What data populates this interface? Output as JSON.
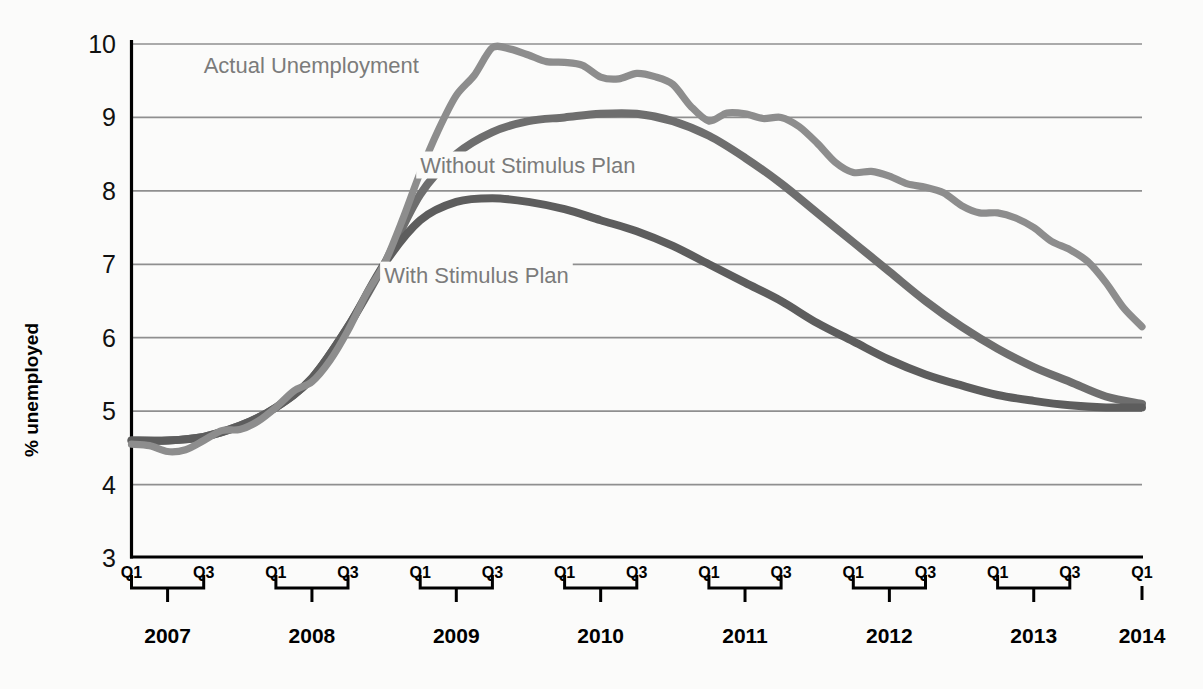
{
  "chart_data": {
    "type": "line",
    "title": "",
    "xlabel": "",
    "ylabel": "% unemployed",
    "ylim": [
      3,
      10
    ],
    "yticks": [
      3,
      4,
      5,
      6,
      7,
      8,
      9,
      10
    ],
    "ytick_labels": [
      "3",
      "4",
      "5",
      "6",
      "7",
      "8",
      "9",
      "10"
    ],
    "grid": true,
    "grid_axis": "y",
    "legend_position": "inline-annotations",
    "x_start": "2007 Q1",
    "x_end": "2014 Q1",
    "x_unit": "quarter",
    "years": [
      "2007",
      "2008",
      "2009",
      "2010",
      "2011",
      "2012",
      "2013",
      "2014"
    ],
    "quarter_tick_labels": [
      "Q1",
      "Q3"
    ],
    "final_year_quarter_labels": [
      "Q1"
    ],
    "colors": {
      "actual": "#8d8d8d",
      "without_stimulus": "#6e6e6e",
      "with_stimulus": "#5d5d5d",
      "gridline": "#8f8f8f",
      "axis": "#000000",
      "background": "#fbfbfa",
      "label_text": "#7b7b7b"
    },
    "series": [
      {
        "name": "Actual Unemployment",
        "label": "Actual Unemployment",
        "color": "#8d8d8d",
        "x": [
          "2007Q1",
          "2007Q2",
          "2007Q3",
          "2007Q4",
          "2008Q1",
          "2008Q2",
          "2008Q3",
          "2008Q4",
          "2009Q1",
          "2009Q2",
          "2009Q3",
          "2009Q4",
          "2010Q1",
          "2010Q2",
          "2010Q3",
          "2010Q4",
          "2011Q1",
          "2011Q2",
          "2011Q3",
          "2011Q4",
          "2012Q1",
          "2012Q2",
          "2012Q3",
          "2012Q4",
          "2013Q1",
          "2013Q2",
          "2013Q3",
          "2013Q4",
          "2014Q1"
        ],
        "values": [
          4.55,
          4.45,
          4.6,
          4.75,
          5.05,
          5.4,
          6.1,
          7.0,
          8.25,
          9.3,
          9.95,
          9.85,
          9.75,
          9.55,
          9.6,
          9.45,
          8.95,
          9.05,
          9.0,
          8.65,
          8.25,
          8.2,
          8.05,
          7.8,
          7.7,
          7.5,
          7.2,
          6.75,
          6.15
        ]
      },
      {
        "name": "Without Stimulus Plan",
        "label": "Without Stimulus Plan",
        "color": "#6e6e6e",
        "x": [
          "2007Q1",
          "2007Q2",
          "2007Q3",
          "2007Q4",
          "2008Q1",
          "2008Q2",
          "2008Q3",
          "2008Q4",
          "2009Q1",
          "2009Q2",
          "2009Q3",
          "2009Q4",
          "2010Q1",
          "2010Q2",
          "2010Q3",
          "2010Q4",
          "2011Q1",
          "2011Q2",
          "2011Q3",
          "2011Q4",
          "2012Q1",
          "2012Q2",
          "2012Q3",
          "2012Q4",
          "2013Q1",
          "2013Q2",
          "2013Q3",
          "2013Q4",
          "2014Q1"
        ],
        "values": [
          4.6,
          4.6,
          4.65,
          4.8,
          5.05,
          5.45,
          6.15,
          7.0,
          7.95,
          8.5,
          8.8,
          8.95,
          9.0,
          9.05,
          9.05,
          8.95,
          8.75,
          8.45,
          8.1,
          7.7,
          7.3,
          6.9,
          6.5,
          6.15,
          5.85,
          5.6,
          5.4,
          5.2,
          5.1
        ]
      },
      {
        "name": "With Stimulus Plan",
        "label": "With Stimulus Plan",
        "color": "#5d5d5d",
        "x": [
          "2007Q1",
          "2007Q2",
          "2007Q3",
          "2007Q4",
          "2008Q1",
          "2008Q2",
          "2008Q3",
          "2008Q4",
          "2009Q1",
          "2009Q2",
          "2009Q3",
          "2009Q4",
          "2010Q1",
          "2010Q2",
          "2010Q3",
          "2010Q4",
          "2011Q1",
          "2011Q2",
          "2011Q3",
          "2011Q4",
          "2012Q1",
          "2012Q2",
          "2012Q3",
          "2012Q4",
          "2013Q1",
          "2013Q2",
          "2013Q3",
          "2013Q4",
          "2014Q1"
        ],
        "values": [
          4.6,
          4.6,
          4.65,
          4.8,
          5.05,
          5.45,
          6.15,
          7.0,
          7.6,
          7.85,
          7.9,
          7.85,
          7.75,
          7.6,
          7.45,
          7.25,
          7.0,
          6.75,
          6.5,
          6.2,
          5.95,
          5.7,
          5.5,
          5.35,
          5.22,
          5.14,
          5.08,
          5.05,
          5.05
        ]
      }
    ],
    "annotations": [
      {
        "text": "Actual Unemployment",
        "x": "2007Q3",
        "y": 9.6
      },
      {
        "text": "Without Stimulus Plan",
        "x": "2009Q1",
        "y": 8.25
      },
      {
        "text": "With Stimulus Plan",
        "x": "2008Q4",
        "y": 6.75
      }
    ]
  }
}
